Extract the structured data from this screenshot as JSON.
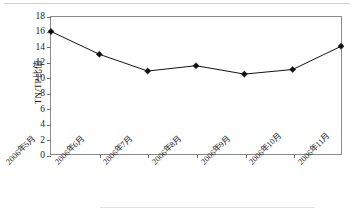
{
  "figure": {
    "background": "#ffffff",
    "frame_color": "#8a8a8a",
    "series_color": "#111111"
  },
  "chart_data": {
    "type": "line",
    "title": "",
    "xlabel": "",
    "ylabel": "TN/TP比值",
    "categories": [
      "2006年5月",
      "2006年6月",
      "2006年7月",
      "2006年8月",
      "2006年9月",
      "2006年10月",
      "2006年11月"
    ],
    "values": [
      16.1,
      13.1,
      10.9,
      11.6,
      10.5,
      11.1,
      14.15
    ],
    "ylim": [
      0,
      18
    ],
    "ytick_values": [
      0,
      2,
      4,
      6,
      8,
      10,
      12,
      14,
      16,
      18
    ],
    "ytick_labels": [
      "0",
      "2",
      "4",
      "6",
      "8",
      "10",
      "12",
      "14",
      "16",
      "18"
    ],
    "grid": false,
    "legend": false,
    "marker": "diamond",
    "line_style": "solid"
  }
}
